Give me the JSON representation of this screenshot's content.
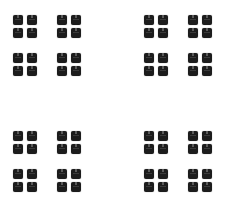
{
  "pattern": {
    "description": "fractal grid of dark square glyph blocks",
    "colors": {
      "background": "#ffffff",
      "block": "#1c1c1c"
    },
    "quadrants": [
      {
        "name": "top-left",
        "x": 13,
        "y": 15
      },
      {
        "name": "top-right",
        "x": 144,
        "y": 15
      },
      {
        "name": "bottom-left",
        "x": 13,
        "y": 131
      },
      {
        "name": "bottom-right",
        "x": 144,
        "y": 131
      }
    ],
    "group_offsets": [
      [
        0,
        0
      ],
      [
        44,
        0
      ],
      [
        0,
        38
      ],
      [
        44,
        38
      ]
    ],
    "block_offsets": [
      [
        0,
        0
      ],
      [
        14,
        0
      ],
      [
        0,
        13
      ],
      [
        14,
        13
      ]
    ],
    "block_size": 10
  }
}
